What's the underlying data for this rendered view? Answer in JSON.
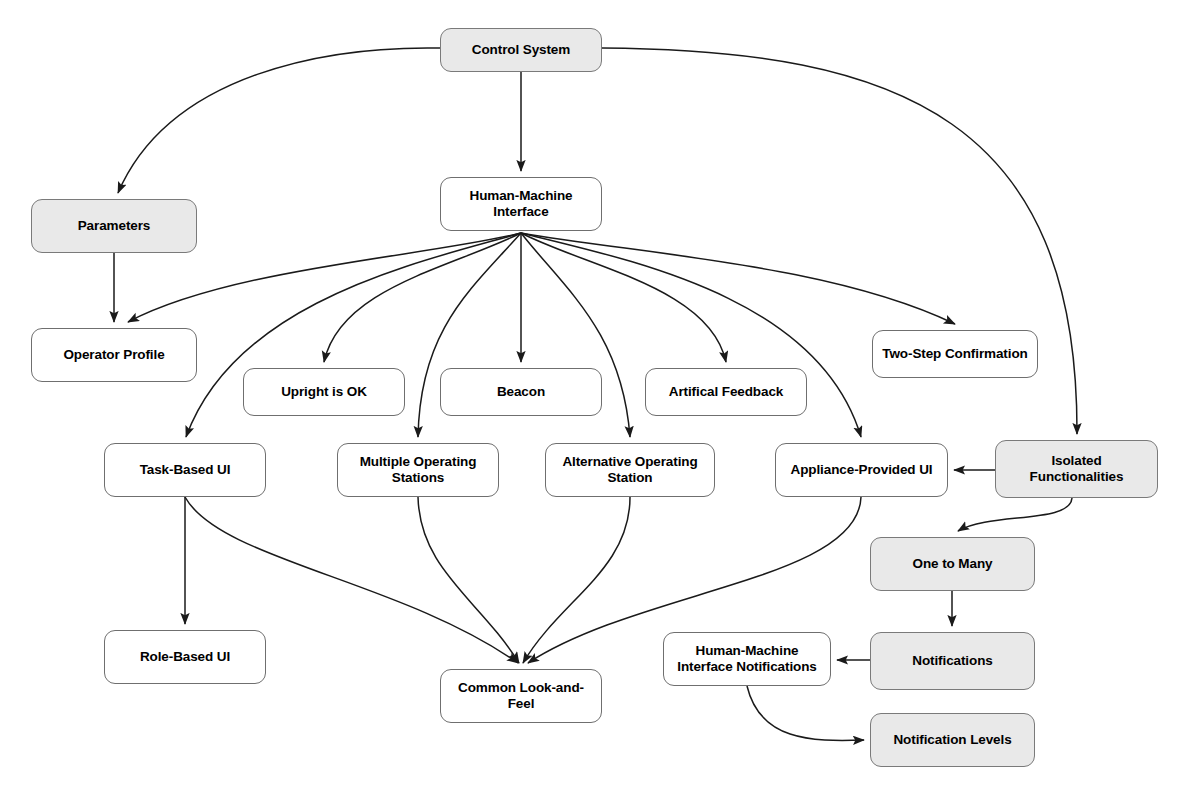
{
  "diagram": {
    "type": "directed-graph",
    "background_color": "#ffffff",
    "node_fill_plain": "#ffffff",
    "node_fill_shaded": "#e9e9e9",
    "node_border_color": "#6f6f6f",
    "edge_color": "#1a1a1a",
    "nodes": [
      {
        "id": "control-system",
        "label": "Control System",
        "shaded": true,
        "x": 440,
        "y": 28,
        "w": 162,
        "h": 44
      },
      {
        "id": "parameters",
        "label": "Parameters",
        "shaded": true,
        "x": 31,
        "y": 199,
        "w": 166,
        "h": 54
      },
      {
        "id": "human-machine-interface",
        "label": "Human-Machine\nInterface",
        "shaded": false,
        "x": 440,
        "y": 177,
        "w": 162,
        "h": 54
      },
      {
        "id": "operator-profile",
        "label": "Operator Profile",
        "shaded": false,
        "x": 31,
        "y": 328,
        "w": 166,
        "h": 54
      },
      {
        "id": "upright-is-ok",
        "label": "Upright is OK",
        "shaded": false,
        "x": 243,
        "y": 368,
        "w": 162,
        "h": 48
      },
      {
        "id": "beacon",
        "label": "Beacon",
        "shaded": false,
        "x": 440,
        "y": 368,
        "w": 162,
        "h": 48
      },
      {
        "id": "artifical-feedback",
        "label": "Artifical Feedback",
        "shaded": false,
        "x": 645,
        "y": 368,
        "w": 162,
        "h": 48
      },
      {
        "id": "two-step-confirmation",
        "label": "Two-Step Confirmation",
        "shaded": false,
        "x": 872,
        "y": 330,
        "w": 166,
        "h": 48
      },
      {
        "id": "task-based-ui",
        "label": "Task-Based UI",
        "shaded": false,
        "x": 104,
        "y": 443,
        "w": 162,
        "h": 54
      },
      {
        "id": "multiple-operating-stations",
        "label": "Multiple Operating\nStations",
        "shaded": false,
        "x": 337,
        "y": 443,
        "w": 162,
        "h": 54
      },
      {
        "id": "alternative-operating-station",
        "label": "Alternative Operating\nStation",
        "shaded": false,
        "x": 545,
        "y": 443,
        "w": 170,
        "h": 54
      },
      {
        "id": "appliance-provided-ui",
        "label": "Appliance-Provided UI",
        "shaded": false,
        "x": 775,
        "y": 443,
        "w": 173,
        "h": 54
      },
      {
        "id": "isolated-functionalities",
        "label": "Isolated\nFunctionalities",
        "shaded": true,
        "x": 995,
        "y": 440,
        "w": 163,
        "h": 58
      },
      {
        "id": "one-to-many",
        "label": "One to Many",
        "shaded": true,
        "x": 870,
        "y": 537,
        "w": 165,
        "h": 54
      },
      {
        "id": "role-based-ui",
        "label": "Role-Based UI",
        "shaded": false,
        "x": 104,
        "y": 630,
        "w": 162,
        "h": 54
      },
      {
        "id": "common-look-and-feel",
        "label": "Common Look-and-\nFeel",
        "shaded": false,
        "x": 440,
        "y": 669,
        "w": 162,
        "h": 54
      },
      {
        "id": "hmi-notifications",
        "label": "Human-Machine\nInterface Notifications",
        "shaded": false,
        "x": 663,
        "y": 632,
        "w": 168,
        "h": 54
      },
      {
        "id": "notifications",
        "label": "Notifications",
        "shaded": true,
        "x": 870,
        "y": 632,
        "w": 165,
        "h": 58
      },
      {
        "id": "notification-levels",
        "label": "Notification Levels",
        "shaded": true,
        "x": 870,
        "y": 713,
        "w": 165,
        "h": 54
      }
    ],
    "edges": [
      {
        "from": "control-system",
        "to": "parameters",
        "path": "M 440 48 C 330 46 170 72 118 193",
        "arrow": true
      },
      {
        "from": "control-system",
        "to": "human-machine-interface",
        "path": "M 521 72 L 521 171",
        "arrow": true
      },
      {
        "from": "control-system",
        "to": "isolated-functionalities",
        "path": "M 602 48 C 900 50 1078 120 1077 434",
        "arrow": true
      },
      {
        "from": "parameters",
        "to": "operator-profile",
        "path": "M 114 253 L 114 322",
        "arrow": true
      },
      {
        "from": "human-machine-interface",
        "to": "operator-profile",
        "path": "M 521 233 C 430 256 230 268 128 322",
        "arrow": true
      },
      {
        "from": "human-machine-interface",
        "to": "task-based-ui",
        "path": "M 521 233 C 420 262 236 300 186 437",
        "arrow": true
      },
      {
        "from": "human-machine-interface",
        "to": "upright-is-ok",
        "path": "M 521 233 C 450 268 340 288 324 362",
        "arrow": true
      },
      {
        "from": "human-machine-interface",
        "to": "multiple-operating-stations",
        "path": "M 521 233 C 470 290 420 330 418 437",
        "arrow": true
      },
      {
        "from": "human-machine-interface",
        "to": "beacon",
        "path": "M 521 233 L 521 362",
        "arrow": true
      },
      {
        "from": "human-machine-interface",
        "to": "alternative-operating-station",
        "path": "M 521 233 C 566 290 622 332 630 437",
        "arrow": true
      },
      {
        "from": "human-machine-interface",
        "to": "artifical-feedback",
        "path": "M 521 233 C 590 268 710 288 726 362",
        "arrow": true
      },
      {
        "from": "human-machine-interface",
        "to": "appliance-provided-ui",
        "path": "M 521 233 C 640 262 820 300 861 437",
        "arrow": true
      },
      {
        "from": "human-machine-interface",
        "to": "two-step-confirmation",
        "path": "M 521 233 C 640 254 830 264 955 324",
        "arrow": true
      },
      {
        "from": "task-based-ui",
        "to": "role-based-ui",
        "path": "M 185 497 L 185 624",
        "arrow": true
      },
      {
        "from": "task-based-ui",
        "to": "common-look-and-feel",
        "path": "M 185 497 C 220 560 400 580 518 663",
        "arrow": true
      },
      {
        "from": "multiple-operating-stations",
        "to": "common-look-and-feel",
        "path": "M 418 497 C 420 570 480 600 519 663",
        "arrow": true
      },
      {
        "from": "alternative-operating-station",
        "to": "common-look-and-feel",
        "path": "M 630 497 C 630 570 560 600 523 663",
        "arrow": true
      },
      {
        "from": "appliance-provided-ui",
        "to": "common-look-and-feel",
        "path": "M 861 497 C 858 580 640 590 528 663",
        "arrow": true
      },
      {
        "from": "isolated-functionalities",
        "to": "appliance-provided-ui",
        "path": "M 995 470 L 954 470",
        "arrow": true
      },
      {
        "from": "isolated-functionalities",
        "to": "one-to-many",
        "path": "M 1072 498 C 1070 524 990 512 958 531",
        "arrow": true
      },
      {
        "from": "one-to-many",
        "to": "notifications",
        "path": "M 952 591 L 952 626",
        "arrow": true
      },
      {
        "from": "notifications",
        "to": "hmi-notifications",
        "path": "M 870 660 L 837 660",
        "arrow": true
      },
      {
        "from": "hmi-notifications",
        "to": "notification-levels",
        "path": "M 747 686 C 760 740 810 742 864 740",
        "arrow": true
      }
    ]
  }
}
